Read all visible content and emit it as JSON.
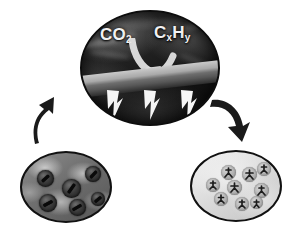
{
  "figure": {
    "background_color": "#ffffff",
    "panel_border_color": "#111111",
    "arrow_color": "#1a1a1a"
  },
  "panels": {
    "top": {
      "name": "plasma-co2-conversion-panel",
      "description": "Dark smoky plasma region above a grey catalyst slab with lightning discharges",
      "reactant_label": "CO",
      "reactant_subscript": "2",
      "product_label": "C",
      "product_sub1": "x",
      "product_label2": "H",
      "product_sub2": "y",
      "slab_name": "catalyst-slab",
      "bolt_count": 3,
      "bolt_label": "lightning-bolt",
      "colors": {
        "plasma_dark": "#141414",
        "plasma_mid": "#3c3c3c",
        "slab_light": "#c9c9c9",
        "slab_dark": "#4a4a4a",
        "text": "#f2f2f2"
      }
    },
    "bottom_left": {
      "name": "porous-support-panel",
      "description": "Dark porous support with large pores each holding an elongated metal particle",
      "pore_count": 6,
      "pores": [
        {
          "cx": 23,
          "cy": 25,
          "r": 8.5,
          "rod_w": 9,
          "rod_h": 3,
          "rot": -42
        },
        {
          "cx": 49,
          "cy": 35,
          "r": 9.5,
          "rod_w": 11,
          "rod_h": 3,
          "rot": -55
        },
        {
          "cx": 71,
          "cy": 21,
          "r": 8.0,
          "rod_w": 9,
          "rod_h": 3,
          "rot": -48
        },
        {
          "cx": 26,
          "cy": 50,
          "r": 9.0,
          "rod_w": 10,
          "rod_h": 3,
          "rot": -28
        },
        {
          "cx": 55,
          "cy": 54,
          "r": 8.5,
          "rod_w": 10,
          "rod_h": 3,
          "rot": -30
        },
        {
          "cx": 76,
          "cy": 46,
          "r": 7.0,
          "rod_w": 8,
          "rod_h": 3,
          "rot": -40
        }
      ],
      "colors": {
        "support": "#6f6f6f",
        "pore": "#2a2a2a",
        "particle": "#0a0a0a"
      }
    },
    "bottom_right": {
      "name": "dispersed-nanoparticle-panel",
      "description": "Light support with many small spherical particles containing dark branched clusters",
      "particle_count": 9,
      "particles": [
        {
          "cx": 36,
          "cy": 20,
          "r": 7.5
        },
        {
          "cx": 57,
          "cy": 22,
          "r": 7.5
        },
        {
          "cx": 72,
          "cy": 17,
          "r": 7.0
        },
        {
          "cx": 21,
          "cy": 33,
          "r": 7.0
        },
        {
          "cx": 42,
          "cy": 35,
          "r": 7.5
        },
        {
          "cx": 69,
          "cy": 38,
          "r": 7.5
        },
        {
          "cx": 29,
          "cy": 47,
          "r": 7.0
        },
        {
          "cx": 50,
          "cy": 52,
          "r": 7.0
        },
        {
          "cx": 64,
          "cy": 50,
          "r": 6.5
        }
      ],
      "colors": {
        "support": "#e0e0e0",
        "particle": "#b2b2b2",
        "cluster": "#1c1c1c"
      }
    }
  },
  "arrows": {
    "left": {
      "name": "arrow-regeneration-up",
      "direction": "up-right",
      "from": "bottom-left-panel",
      "to": "top-panel",
      "color": "#1a1a1a"
    },
    "right": {
      "name": "arrow-restructuring-down",
      "direction": "down-right",
      "from": "top-panel",
      "to": "bottom-right-panel",
      "color": "#1a1a1a"
    },
    "conversion": {
      "name": "arrow-gas-conversion",
      "direction": "down-curved",
      "color": "#e8e8e8"
    }
  }
}
